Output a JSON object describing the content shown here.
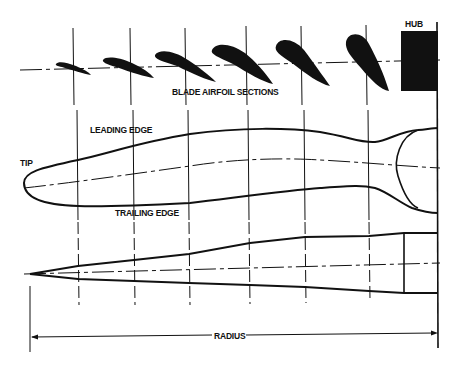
{
  "diagram": {
    "labels": {
      "hub": "HUB",
      "airfoil_sections": "BLADE AIRFOIL SECTIONS",
      "leading_edge": "LEADING EDGE",
      "tip": "TIP",
      "trailing_edge": "TRAILING EDGE",
      "radius": "RADIUS"
    },
    "station_lines_x": [
      78,
      134,
      189,
      250,
      305,
      369,
      438
    ],
    "airfoil_sections_count": 6,
    "views": [
      "blade airfoil sections",
      "planform view",
      "side (thickness) view",
      "radius dimension"
    ],
    "colors": {
      "ink": "#111111",
      "background": "#ffffff"
    }
  }
}
